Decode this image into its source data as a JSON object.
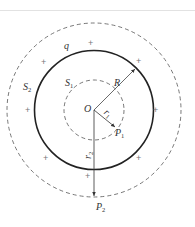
{
  "diagram": {
    "type": "gauss-law-charged-sphere",
    "labels": {
      "charge": "q",
      "center": "O",
      "radius": "R",
      "inner_surface": "S",
      "inner_surface_sub": "1",
      "outer_surface": "S",
      "outer_surface_sub": "2",
      "r1": "r",
      "r1_sub": "1",
      "r2": "r",
      "r2_sub": "2",
      "p1": "P",
      "p1_sub": "1",
      "p2": "P",
      "p2_sub": "2"
    },
    "charge_sign": "+",
    "plus_count": 8,
    "caption": ""
  }
}
